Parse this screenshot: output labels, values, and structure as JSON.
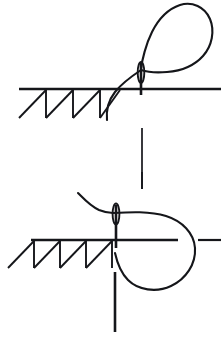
{
  "figure": {
    "title": "Needle and thread loop formation",
    "type": "technical-line-drawing",
    "background_color": "#ffffff",
    "ink_color": "#15161a",
    "width": 221,
    "height": 345,
    "panels": [
      {
        "id": "upper-panel",
        "name": "upper-stage-loop-open",
        "description": "Needle piercing hatched material with open thread loop arcing to the upper right",
        "elements": [
          {
            "name": "material-surface-line",
            "kind": "horizontal-line"
          },
          {
            "name": "material-hatching",
            "kind": "sawtooth-hatch",
            "tooth_count": 4
          },
          {
            "name": "needle-shaft",
            "kind": "vertical-line"
          },
          {
            "name": "needle-eye",
            "kind": "ellipse"
          },
          {
            "name": "thread-open-loop",
            "kind": "curve"
          },
          {
            "name": "needle-shaft-lower-extension",
            "kind": "vertical-line"
          }
        ]
      },
      {
        "id": "lower-panel",
        "name": "lower-stage-loop-closed",
        "description": "Needle piercing hatched material with thread loop closed into a pear shape to the right",
        "elements": [
          {
            "name": "material-surface-line",
            "kind": "horizontal-line"
          },
          {
            "name": "material-hatching",
            "kind": "sawtooth-hatch",
            "tooth_count": 4
          },
          {
            "name": "needle-shaft",
            "kind": "vertical-line"
          },
          {
            "name": "needle-eye",
            "kind": "ellipse"
          },
          {
            "name": "thread-closed-loop",
            "kind": "closed-curve"
          },
          {
            "name": "thread-tail",
            "kind": "curve"
          },
          {
            "name": "right-short-dash",
            "kind": "horizontal-dash"
          },
          {
            "name": "needle-shaft-lower-extension",
            "kind": "vertical-line"
          }
        ]
      }
    ],
    "labels": []
  }
}
